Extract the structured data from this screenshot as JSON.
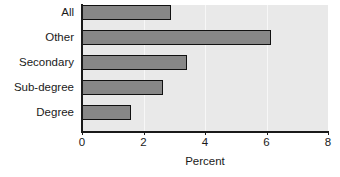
{
  "chart_data": {
    "type": "bar",
    "orientation": "horizontal",
    "title": "",
    "xlabel": "Percent",
    "ylabel": "",
    "xlim": [
      0,
      8
    ],
    "xticks": [
      0,
      2,
      4,
      6,
      8
    ],
    "xtick_labels": [
      "0",
      "2",
      "4",
      "6",
      "8"
    ],
    "grid": true,
    "grid_axis": "x",
    "legend": false,
    "categories": [
      "All",
      "Other",
      "Secondary",
      "Sub-degree",
      "Degree"
    ],
    "values": [
      2.9,
      6.15,
      3.4,
      2.65,
      1.6
    ],
    "bar_fill_color": "#878787",
    "bar_edge_color": "#111111",
    "panel_background_color": "#e9e9e9",
    "gridline_color": "#f7f7f7",
    "axis_color": "#1a1a1a"
  }
}
